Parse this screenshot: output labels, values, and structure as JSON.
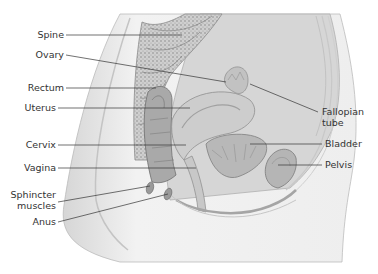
{
  "diagram": {
    "type": "anatomical sagittal section",
    "labels_left": [
      {
        "id": "spine",
        "text": "Spine"
      },
      {
        "id": "ovary",
        "text": "Ovary"
      },
      {
        "id": "rectum",
        "text": "Rectum"
      },
      {
        "id": "uterus",
        "text": "Uterus"
      },
      {
        "id": "cervix",
        "text": "Cervix"
      },
      {
        "id": "vagina",
        "text": "Vagina"
      },
      {
        "id": "sphincter",
        "text": "Sphincter\nmuscles",
        "line1": "Sphincter",
        "line2": "muscles"
      },
      {
        "id": "anus",
        "text": "Anus"
      }
    ],
    "labels_right": [
      {
        "id": "fallopian",
        "text": "Fallopian\ntube",
        "line1": "Fallopian",
        "line2": "tube"
      },
      {
        "id": "bladder",
        "text": "Bladder"
      },
      {
        "id": "pelvis",
        "text": "Pelvis"
      }
    ],
    "colors": {
      "body_fill": "#ececec",
      "cavity_fill": "#d9d9d9",
      "organ_fill": "#bdbdbd",
      "organ_dark": "#8f8f8f",
      "line": "#333333",
      "text": "#333333"
    }
  }
}
